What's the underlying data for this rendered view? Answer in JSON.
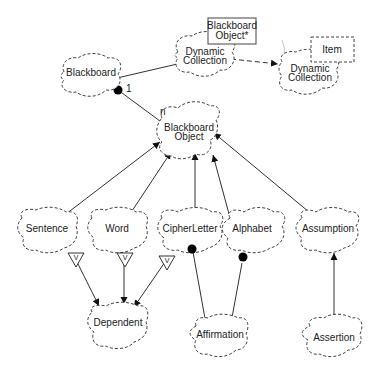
{
  "diagram": {
    "type": "Booch class diagram",
    "classes": {
      "blackboard": "Blackboard",
      "dynamic_collection_1": "Dynamic Collection",
      "dynamic_collection_1_line1": "Dynamic",
      "dynamic_collection_1_line2": "Collection",
      "dynamic_collection_1_param_line1": "Blackboard",
      "dynamic_collection_1_param_line2": "Object*",
      "dynamic_collection_2_line1": "Dynamic",
      "dynamic_collection_2_line2": "Collection",
      "dynamic_collection_2_param": "Item",
      "blackboard_object_line1": "Blackboard",
      "blackboard_object_line2": "Object",
      "sentence": "Sentence",
      "word": "Word",
      "cipher_letter": "CipherLetter",
      "alphabet": "Alphabet",
      "assumption": "Assumption",
      "dependent": "Dependent",
      "affirmation": "Affirmation",
      "assertion": "Assertion"
    },
    "relationships": {
      "blackboard_to_object_multiplicity_source": "1",
      "blackboard_to_object_multiplicity_target": "n",
      "virtual_marker": "V"
    },
    "edges": [
      {
        "from": "Blackboard",
        "to": "Dynamic Collection (Blackboard Object*)",
        "kind": "uses"
      },
      {
        "from": "Dynamic Collection (Blackboard Object*)",
        "to": "Dynamic Collection (Item)",
        "kind": "instantiates"
      },
      {
        "from": "Blackboard",
        "to": "Blackboard Object",
        "kind": "has",
        "source_mult": "1",
        "target_mult": "n"
      },
      {
        "from": "Sentence",
        "to": "Blackboard Object",
        "kind": "inherits"
      },
      {
        "from": "Word",
        "to": "Blackboard Object",
        "kind": "inherits"
      },
      {
        "from": "CipherLetter",
        "to": "Blackboard Object",
        "kind": "inherits"
      },
      {
        "from": "Alphabet",
        "to": "Blackboard Object",
        "kind": "inherits"
      },
      {
        "from": "Assumption",
        "to": "Blackboard Object",
        "kind": "inherits"
      },
      {
        "from": "Sentence",
        "to": "Dependent",
        "kind": "virtual inherits"
      },
      {
        "from": "Word",
        "to": "Dependent",
        "kind": "virtual inherits"
      },
      {
        "from": "CipherLetter",
        "to": "Dependent",
        "kind": "virtual inherits"
      },
      {
        "from": "Affirmation",
        "to": "CipherLetter",
        "kind": "has"
      },
      {
        "from": "Affirmation",
        "to": "Alphabet",
        "kind": "has"
      },
      {
        "from": "Assertion",
        "to": "Assumption",
        "kind": "inherits"
      }
    ]
  }
}
